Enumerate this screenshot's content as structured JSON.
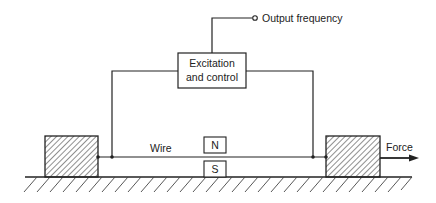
{
  "diagram": {
    "type": "vibrating-wire-force-sensor",
    "labels": {
      "output": "Output frequency",
      "control_line1": "Excitation",
      "control_line2": "and control",
      "wire": "Wire",
      "north": "N",
      "south": "S",
      "force": "Force"
    },
    "colors": {
      "line": "#222222",
      "background": "#ffffff"
    }
  }
}
